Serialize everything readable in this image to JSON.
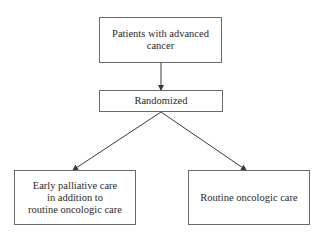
{
  "diagram": {
    "type": "flowchart",
    "nodes": {
      "population": {
        "label": "Patients with advanced\ncancer"
      },
      "randomized": {
        "label": "Randomized"
      },
      "arm_early": {
        "label": "Early palliative care\nin addition to\nroutine oncologic care"
      },
      "arm_routine": {
        "label": "Routine oncologic care"
      }
    },
    "edges": [
      {
        "from": "population",
        "to": "randomized"
      },
      {
        "from": "randomized",
        "to": "arm_early"
      },
      {
        "from": "randomized",
        "to": "arm_routine"
      }
    ],
    "colors": {
      "line": "#3a3a3a",
      "border": "#6a6a6a",
      "text": "#2a2a2a",
      "background": "#ffffff"
    }
  }
}
